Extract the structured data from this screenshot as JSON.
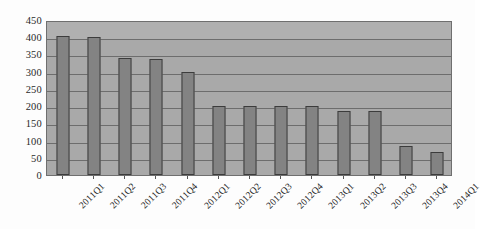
{
  "chart_data": {
    "type": "bar",
    "title": "",
    "subtitle": "",
    "xlabel": "",
    "ylabel": "",
    "categories": [
      "2011Q1",
      "2011Q2",
      "2011Q3",
      "2011Q4",
      "2012Q1",
      "2012Q2",
      "2012Q3",
      "2012Q4",
      "2013Q1",
      "2013Q2",
      "2013Q3",
      "2013Q4",
      "2014Q1"
    ],
    "values": [
      403,
      400,
      340,
      338,
      298,
      200,
      200,
      200,
      200,
      185,
      185,
      84,
      66
    ],
    "series": [
      {
        "name": "",
        "values": [
          403,
          400,
          340,
          338,
          298,
          200,
          200,
          200,
          200,
          185,
          185,
          84,
          66
        ]
      }
    ],
    "ylim": [
      0,
      450
    ],
    "ytick_labels": [
      "0",
      "50",
      "100",
      "150",
      "200",
      "250",
      "300",
      "350",
      "400",
      "450"
    ],
    "ytick_values": [
      0,
      50,
      100,
      150,
      200,
      250,
      300,
      350,
      400,
      450
    ],
    "grid": true,
    "grid_axis": "y",
    "legend": false,
    "legend_position": "none",
    "xtick_label_rotation": -45,
    "colors": {
      "bar_fill": "#838383",
      "bar_border": "#3c3c3c",
      "plot_background": "#a9a9a9",
      "plot_border": "#6f6f6f",
      "gridline": "#6d6d6d",
      "text": "#1f1f1f",
      "page_background": "#fdfdfd"
    }
  }
}
